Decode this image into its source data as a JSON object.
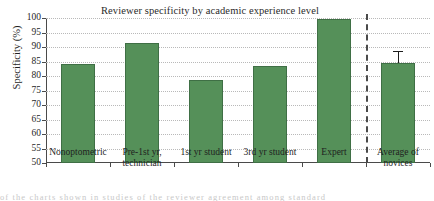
{
  "chart_data": {
    "type": "bar",
    "title": "Reviewer specificity by academic experience level",
    "xlabel": "",
    "ylabel": "Specificity (%)",
    "ylim": [
      50,
      100
    ],
    "ytick_step": 5,
    "yticks": [
      100,
      95,
      90,
      85,
      80,
      75,
      70,
      65,
      60,
      55,
      50
    ],
    "grid": "horizontal-dotted",
    "legend": "none",
    "categories": [
      "Nonoptometric",
      "Pre-1st yr, technician",
      "1st yr student",
      "3rd yr student",
      "Expert",
      "Average of novices"
    ],
    "category_lines": [
      [
        "Nonoptometric"
      ],
      [
        "Pre-1st yr,",
        "technician"
      ],
      [
        "1st yr student"
      ],
      [
        "3rd yr student"
      ],
      [
        "Expert"
      ],
      [
        "Average of",
        "novices"
      ]
    ],
    "values": [
      84.3,
      91.5,
      78.7,
      83.5,
      99.5,
      84.6
    ],
    "errors": [
      null,
      null,
      null,
      null,
      null,
      3.9
    ],
    "annotations": [
      "Vertical dashed divider separates the five experience-level groups from the 'Average of novices' summary bar"
    ],
    "series": [
      {
        "name": "Specificity",
        "values": [
          84.3,
          91.5,
          78.7,
          83.5,
          99.5,
          84.6
        ]
      }
    ],
    "colors": {
      "bar_fill": "#559059",
      "bar_edge": "#3f6f45",
      "grid": "#b9b9b9",
      "axis": "#4a4a4a",
      "text": "#1f1f1f",
      "error_bar": "#1c1c1c"
    }
  },
  "page_artifact": {
    "text": "of the charts shown in studies of the reviewer agreement among standard"
  }
}
